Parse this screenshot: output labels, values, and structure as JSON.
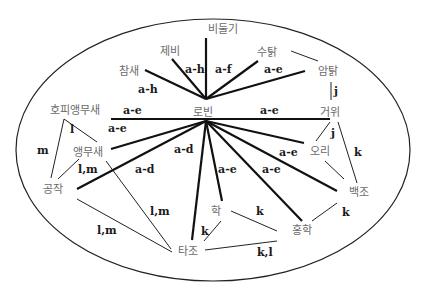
{
  "diagram": {
    "hub": "로빈",
    "nodes": {
      "bidulgi": "비둘기",
      "jebi": "제비",
      "chamsae": "참새",
      "sutak": "수탉",
      "amtak": "암탉",
      "hopi": "호피앵무새",
      "robin": "로빈",
      "geowi": "거위",
      "aengmusae": "앵무새",
      "ori": "오리",
      "gongjak": "공작",
      "baekjo": "백조",
      "hak": "학",
      "honghak": "홍학",
      "tajo": "타조"
    },
    "edge_labels": {
      "robin_chamsae": "a-h",
      "robin_jebi": "a-h",
      "robin_sutak": "a-f",
      "robin_amtak": "a-e",
      "robin_hopi": "a-e",
      "robin_geowi": "a-e",
      "robin_aengmusae": "a-e",
      "robin_gongjak": "a-d",
      "robin_tajo": "a-d",
      "robin_hak": "a-e",
      "robin_honghak": "a-e",
      "robin_baekjo": "a-e",
      "amtak_geowi": "j",
      "geowi_ori": "j",
      "geowi_baekjo": "k",
      "hopi_aengmusae": "l",
      "hopi_gongjak": "m",
      "aengmusae_gongjak": "l,m",
      "aengmusae_tajo": "l,m",
      "gongjak_tajo": "l,m",
      "hak_tajo": "k",
      "hak_honghak": "k",
      "honghak_baekjo": "k",
      "tajo_honghak": "k,l"
    },
    "edges": [
      {
        "from": "로빈",
        "to": "비둘기",
        "label": "",
        "weight": "thick"
      },
      {
        "from": "로빈",
        "to": "제비",
        "label": "a-h",
        "weight": "thick"
      },
      {
        "from": "로빈",
        "to": "참새",
        "label": "a-h",
        "weight": "thick"
      },
      {
        "from": "로빈",
        "to": "수탉",
        "label": "a-f",
        "weight": "thick"
      },
      {
        "from": "로빈",
        "to": "암탉",
        "label": "a-e",
        "weight": "thick"
      },
      {
        "from": "로빈",
        "to": "호피앵무새",
        "label": "a-e",
        "weight": "thick"
      },
      {
        "from": "로빈",
        "to": "거위",
        "label": "a-e",
        "weight": "thick"
      },
      {
        "from": "로빈",
        "to": "앵무새",
        "label": "a-e",
        "weight": "thick"
      },
      {
        "from": "로빈",
        "to": "오리",
        "label": "",
        "weight": "thick"
      },
      {
        "from": "로빈",
        "to": "공작",
        "label": "a-d",
        "weight": "thick"
      },
      {
        "from": "로빈",
        "to": "타조",
        "label": "a-d",
        "weight": "thick"
      },
      {
        "from": "로빈",
        "to": "학",
        "label": "a-e",
        "weight": "thick"
      },
      {
        "from": "로빈",
        "to": "홍학",
        "label": "a-e",
        "weight": "thick"
      },
      {
        "from": "로빈",
        "to": "백조",
        "label": "a-e",
        "weight": "thick"
      },
      {
        "from": "수탉",
        "to": "암탉",
        "label": "",
        "weight": "thin"
      },
      {
        "from": "암탉",
        "to": "거위",
        "label": "j",
        "weight": "thin"
      },
      {
        "from": "거위",
        "to": "오리",
        "label": "j",
        "weight": "thin"
      },
      {
        "from": "거위",
        "to": "백조",
        "label": "k",
        "weight": "thin"
      },
      {
        "from": "오리",
        "to": "백조",
        "label": "",
        "weight": "thin"
      },
      {
        "from": "호피앵무새",
        "to": "앵무새",
        "label": "l",
        "weight": "thin"
      },
      {
        "from": "호피앵무새",
        "to": "공작",
        "label": "m",
        "weight": "thin"
      },
      {
        "from": "앵무새",
        "to": "공작",
        "label": "l,m",
        "weight": "thin"
      },
      {
        "from": "앵무새",
        "to": "타조",
        "label": "l,m",
        "weight": "thin"
      },
      {
        "from": "공작",
        "to": "타조",
        "label": "l,m",
        "weight": "thin"
      },
      {
        "from": "학",
        "to": "타조",
        "label": "k",
        "weight": "thin"
      },
      {
        "from": "학",
        "to": "홍학",
        "label": "k",
        "weight": "thin"
      },
      {
        "from": "홍학",
        "to": "백조",
        "label": "k",
        "weight": "thin"
      },
      {
        "from": "타조",
        "to": "홍학",
        "label": "k,l",
        "weight": "thin"
      }
    ]
  }
}
